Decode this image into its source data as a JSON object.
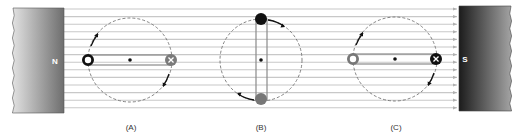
{
  "figure": {
    "width": 528,
    "height": 139,
    "background": "#ffffff",
    "field_lines": {
      "x_start": 64,
      "x_end": 459,
      "y_positions": [
        9,
        16.6,
        24.2,
        31.8,
        39.4,
        47,
        54.6,
        62.2,
        69.8,
        77.4,
        85,
        92.6,
        100.2,
        107.8
      ],
      "color": "#c8c8c8",
      "arrow_color": "#b0b0b0",
      "direction": "right"
    },
    "magnets": {
      "north": {
        "label": "N",
        "x": 13,
        "y": 8,
        "width": 51,
        "height": 105,
        "gradient_from": "#e2e2e2",
        "gradient_to": "#6e6e6e",
        "label_x": 55,
        "label_y": 64,
        "label_color": "#ffffff"
      },
      "south": {
        "label": "S",
        "x": 459,
        "y": 6,
        "width": 52,
        "height": 105,
        "gradient_from": "#1c1c1c",
        "gradient_to": "#a4a4a4",
        "label_x": 465,
        "label_y": 62,
        "label_color": "#ffffff"
      }
    },
    "panels": [
      {
        "id": "A",
        "label": "(A)",
        "label_x": 131,
        "label_y": 130,
        "circle": {
          "cx": 130,
          "cy": 60,
          "r": 42
        },
        "coil_orientation": "horizontal",
        "coil": {
          "x1": 88,
          "y1": 55,
          "x2": 171,
          "y2": 65
        },
        "center_dot": {
          "cx": 130,
          "cy": 60
        },
        "conductors": [
          {
            "position": "left",
            "cx": 88,
            "cy": 60,
            "r": 6,
            "symbol": "dot-ring",
            "color": "#111111"
          },
          {
            "position": "right",
            "cx": 171,
            "cy": 60,
            "r": 6,
            "symbol": "cross",
            "color": "#7a7a7a"
          }
        ],
        "rotation_arrows": [
          {
            "path": "M 91 46 A 42 42 0 0 1 98 34",
            "head": [
              98,
              33
            ]
          },
          {
            "path": "M 169 74 A 42 42 0 0 1 163 86",
            "head": [
              163,
              87
            ]
          }
        ]
      },
      {
        "id": "B",
        "label": "(B)",
        "label_x": 261,
        "label_y": 130,
        "circle": {
          "cx": 261,
          "cy": 60,
          "r": 41
        },
        "coil_orientation": "vertical",
        "coil": {
          "x1": 256,
          "y1": 19,
          "x2": 267,
          "y2": 100
        },
        "center_dot": {
          "cx": 261,
          "cy": 60
        },
        "conductors": [
          {
            "position": "top",
            "cx": 261,
            "cy": 19,
            "r": 6,
            "symbol": "solid",
            "color": "#111111"
          },
          {
            "position": "bottom",
            "cx": 261,
            "cy": 99,
            "r": 6,
            "symbol": "solid",
            "color": "#777777"
          }
        ],
        "rotation_arrows": [
          {
            "path": "M 268 20 A 41 41 0 0 1 284 26",
            "head": [
              285,
              27
            ]
          },
          {
            "path": "M 254 100 A 41 41 0 0 1 238 94",
            "head": [
              237,
              93
            ]
          }
        ]
      },
      {
        "id": "C",
        "label": "(C)",
        "label_x": 396,
        "label_y": 130,
        "circle": {
          "cx": 395,
          "cy": 59,
          "r": 42
        },
        "coil_orientation": "horizontal",
        "coil": {
          "x1": 353,
          "y1": 54,
          "x2": 436,
          "y2": 64
        },
        "center_dot": {
          "cx": 395,
          "cy": 59
        },
        "conductors": [
          {
            "position": "left",
            "cx": 353,
            "cy": 59,
            "r": 6,
            "symbol": "dot-ring",
            "color": "#777777"
          },
          {
            "position": "right",
            "cx": 436,
            "cy": 59,
            "r": 6,
            "symbol": "cross",
            "color": "#111111"
          }
        ],
        "rotation_arrows": [
          {
            "path": "M 356 45 A 42 42 0 0 1 363 33",
            "head": [
              363,
              32
            ]
          },
          {
            "path": "M 434 73 A 42 42 0 0 1 428 85",
            "head": [
              428,
              86
            ]
          }
        ]
      }
    ]
  }
}
